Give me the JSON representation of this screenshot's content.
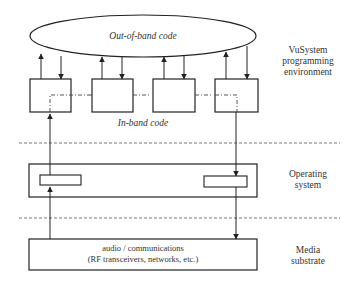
{
  "diagram": {
    "ellipse_label": "Out-of-band code",
    "in_band_label": "In-band code",
    "layers": [
      {
        "name": "vusystem",
        "label_lines": [
          "VuSystem",
          "programming",
          "environment"
        ]
      },
      {
        "name": "os",
        "label_lines": [
          "Operating",
          "system"
        ]
      },
      {
        "name": "media",
        "label_lines": [
          "Media",
          "substrate"
        ]
      }
    ],
    "media_box_lines": [
      "audio /  communications",
      "(RF transceivers, networks, etc.)"
    ],
    "colors": {
      "line": "#222222",
      "dashed": "#555555",
      "background": "#ffffff"
    }
  }
}
